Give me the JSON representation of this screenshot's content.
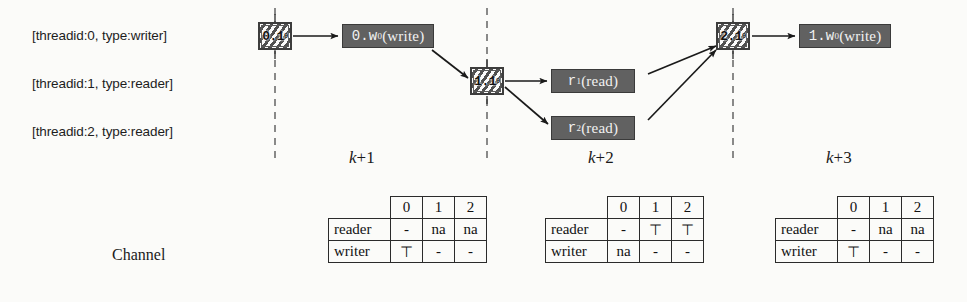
{
  "threads": [
    {
      "label": "[threadid:0, type:writer]"
    },
    {
      "label": "[threadid:1, type:reader]"
    },
    {
      "label": "[threadid:2, type:reader]"
    }
  ],
  "nodes": [
    {
      "id": "n0",
      "text": "0.1",
      "sup": "0"
    },
    {
      "id": "n1",
      "text": "1.1",
      "sup": "0"
    },
    {
      "id": "n2",
      "text": "2.1",
      "sup": "0"
    }
  ],
  "actions": [
    {
      "id": "a0",
      "base": "0.w",
      "sup": "0",
      "paren": "(write)",
      "full": "0.w0(write)"
    },
    {
      "id": "a1",
      "base": "r",
      "sup": "1",
      "paren": "(read)",
      "full": "r1(read)"
    },
    {
      "id": "a2",
      "base": "r",
      "sup": "2",
      "paren": "(read)",
      "full": "r2(read)"
    },
    {
      "id": "a3",
      "base": "1.w",
      "sup": "0",
      "paren": "(write)",
      "full": "1.w0(write)"
    }
  ],
  "phases": [
    {
      "lhs": "k",
      "op": "+",
      "rhs": "1"
    },
    {
      "lhs": "k",
      "op": "+",
      "rhs": "2"
    },
    {
      "lhs": "k",
      "op": "+",
      "rhs": "3"
    }
  ],
  "channel": {
    "caption": "Channel",
    "column_headers": [
      "0",
      "1",
      "2"
    ],
    "row_headers": [
      "reader",
      "writer"
    ],
    "tables": [
      {
        "phase": "k+1",
        "rows": [
          {
            "name": "reader",
            "values": [
              "-",
              "na",
              "na"
            ]
          },
          {
            "name": "writer",
            "values": [
              "⊤",
              "-",
              "-"
            ]
          }
        ]
      },
      {
        "phase": "k+2",
        "rows": [
          {
            "name": "reader",
            "values": [
              "-",
              "⊤",
              "⊤"
            ]
          },
          {
            "name": "writer",
            "values": [
              "na",
              "-",
              "-"
            ]
          }
        ]
      },
      {
        "phase": "k+3",
        "rows": [
          {
            "name": "reader",
            "values": [
              "-",
              "na",
              "na"
            ]
          },
          {
            "name": "writer",
            "values": [
              "⊤",
              "-",
              "-"
            ]
          }
        ]
      }
    ]
  },
  "colors": {
    "action_fill": "#616161",
    "action_text": "#f2f2f2",
    "node_border": "#3d3d3d",
    "edge": "#1a1a1a",
    "page_bg": "#fbfbf9"
  }
}
